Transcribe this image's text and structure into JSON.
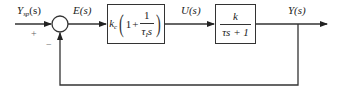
{
  "diagram": {
    "type": "closed-loop control block diagram",
    "input": {
      "label": "Y",
      "subscript": "sp",
      "arg": "(s)"
    },
    "summing_junction": {
      "plus_sign": "+",
      "minus_sign": "−"
    },
    "error_signal": {
      "label": "E(s)"
    },
    "controller": {
      "gain": "k",
      "gain_sub": "c",
      "one": "1",
      "plus": "+",
      "frac_num": "1",
      "frac_den_tau": "τ",
      "frac_den_sub": "I",
      "frac_den_s": "s",
      "lparen": "(",
      "rparen": ")"
    },
    "control_signal": {
      "label": "U(s)"
    },
    "plant": {
      "numerator": "k",
      "denominator": "τs + 1"
    },
    "output": {
      "label": "Y(s)"
    },
    "colors": {
      "line": "#333333",
      "text": "#222222",
      "sign": "#666666",
      "background": "#ffffff"
    }
  }
}
